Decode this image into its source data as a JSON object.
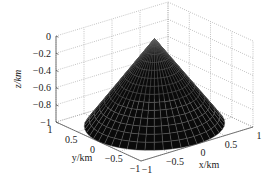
{
  "chart_data": {
    "type": "surface3d",
    "title": "",
    "xlabel": "x/km",
    "ylabel": "y/km",
    "zlabel": "z/km",
    "xlim": [
      -1,
      1
    ],
    "ylim": [
      -1,
      1
    ],
    "zlim": [
      -1,
      0
    ],
    "x_ticks": [
      "-1",
      "-0.5",
      "0",
      "0.5",
      "1"
    ],
    "y_ticks": [
      "1",
      "0.5",
      "0",
      "-0.5",
      "-1"
    ],
    "z_ticks": [
      "0",
      "-0.2",
      "-0.4",
      "-0.6",
      "-0.8",
      "-1"
    ],
    "grid": true,
    "grid_style": "dotted",
    "surface": {
      "shape": "cone",
      "apex": [
        0,
        0,
        0
      ],
      "base_radius": 1,
      "base_z": -1,
      "face_color": "#0a0a0a",
      "edge_color": "#6a6a6a"
    },
    "colors": {
      "surface": "#0a0a0a",
      "mesh": "#6a6a6a",
      "grid": "#9a9a9a",
      "axis": "#555555"
    }
  },
  "labels": {
    "x_axis": "x/km",
    "y_axis": "y/km",
    "z_axis": "z/km"
  }
}
